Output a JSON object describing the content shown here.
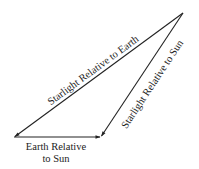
{
  "diagram": {
    "type": "vector-triangle",
    "colors": {
      "line": "#222222",
      "background": "#ffffff",
      "text": "#222222"
    },
    "vertices": {
      "apex": {
        "x": 183,
        "y": 13
      },
      "bottom_left": {
        "x": 14,
        "y": 137
      },
      "bottom_right": {
        "x": 101,
        "y": 137
      }
    },
    "vectors": [
      {
        "id": "starlight-earth",
        "from": "apex",
        "to": "bottom_left",
        "label": "Starlight Relative to Earth"
      },
      {
        "id": "starlight-sun",
        "from": "apex",
        "to": "bottom_right",
        "label": "Starlight Relative to Sun"
      },
      {
        "id": "earth-sun",
        "from": "bottom_left",
        "to": "bottom_right",
        "label_line1": "Earth Relative",
        "label_line2": "to Sun"
      }
    ]
  },
  "labels": {
    "starlight_earth": "Starlight Relative to Earth",
    "starlight_sun": "Starlight Relative to Sun",
    "earth_sun_line1": "Earth Relative",
    "earth_sun_line2": "to Sun"
  }
}
